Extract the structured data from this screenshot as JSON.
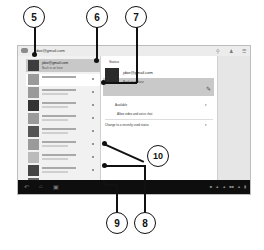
{
  "app": {
    "account": "jdoe@gmail.com"
  },
  "top_actions": [
    "search-icon",
    "add-contact-icon",
    "menu-icon"
  ],
  "sidebar": {
    "self": {
      "email": "jdoe@gmail.com",
      "status": "Back in an hour"
    },
    "contacts_count": 10
  },
  "main": {
    "status_label": "Status",
    "email": "jdoe@gmail.com",
    "status_message": "Back in an hour",
    "availability": "Available",
    "allow_label": "Allow video and voice chat",
    "change_label": "Change to a recently used status"
  },
  "navbar": {
    "buttons": [
      "back",
      "home",
      "recent-apps"
    ],
    "tray_icons": 7
  },
  "callouts": {
    "c5": "5",
    "c6": "6",
    "c7": "7",
    "c8": "8",
    "c9": "9",
    "c10": "10"
  }
}
